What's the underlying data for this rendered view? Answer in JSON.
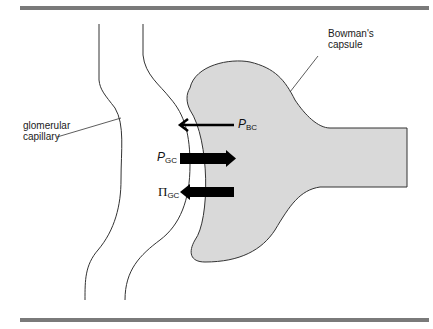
{
  "diagram": {
    "labels": {
      "bowmans_capsule_line1": "Bowman's",
      "bowmans_capsule_line2": "capsule",
      "glomerular_capillary_line1": "glomerular",
      "glomerular_capillary_line2": "capillary"
    },
    "forces": [
      {
        "symbol": "P",
        "subscript": "BC",
        "direction": "left",
        "weight": "thin"
      },
      {
        "symbol": "P",
        "subscript": "GC",
        "direction": "right",
        "weight": "thick"
      },
      {
        "symbol": "Π",
        "subscript": "GC",
        "direction": "left",
        "weight": "thick"
      }
    ],
    "colors": {
      "rule": "#7a7a7a",
      "capsule_fill": "#d9d9d9",
      "outline": "#333333",
      "arrow": "#000000"
    }
  }
}
